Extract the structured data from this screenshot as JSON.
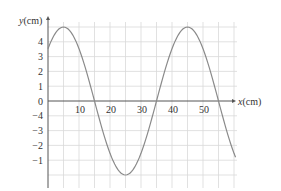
{
  "chart_data": {
    "type": "line",
    "title": "",
    "xlabel": "x(cm)",
    "ylabel": "y(cm)",
    "x_ticks": [
      10,
      20,
      30,
      40,
      50
    ],
    "x_tick_labels": [
      "10",
      "20",
      "30",
      "40",
      "50"
    ],
    "y_tick_labels_positive": [
      "4",
      "3",
      "2",
      "1",
      "0"
    ],
    "y_tick_labels_negative": [
      "−4",
      "−3",
      "−2",
      "−1"
    ],
    "xlim": [
      0,
      61
    ],
    "ylim": [
      -6,
      5.4
    ],
    "grid": true,
    "legend": null,
    "series": [
      {
        "name": "wave",
        "description": "sinusoid, amplitude ~5 cm, wavelength ~40 cm, peaks near x=5 and x=45, trough near x=25, zero crossings near x=15, 35, 55",
        "x": [
          0,
          5,
          10,
          15,
          20,
          25,
          30,
          35,
          40,
          45,
          50,
          55,
          60
        ],
        "y": [
          3.5,
          5,
          3.5,
          0,
          -3.5,
          -5,
          -3.5,
          0,
          3.5,
          5,
          3.5,
          0,
          -4
        ]
      }
    ],
    "colors": {
      "curve": "#8a8a8a",
      "grid": "#d9d9d9",
      "axis": "#555555"
    }
  }
}
